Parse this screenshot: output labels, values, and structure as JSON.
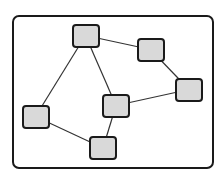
{
  "diagram": {
    "type": "undirected-graph",
    "node_count": 6,
    "edge_count": 7,
    "colors": {
      "frame_border": "#1a1a1a",
      "node_fill": "#d9d9d9",
      "node_border": "#1a1a1a",
      "edge": "#333333",
      "background": "#ffffff"
    },
    "nodes": [
      {
        "id": "n1",
        "label": "",
        "x": 72,
        "y": 24
      },
      {
        "id": "n2",
        "label": "",
        "x": 137,
        "y": 38
      },
      {
        "id": "n3",
        "label": "",
        "x": 175,
        "y": 78
      },
      {
        "id": "n4",
        "label": "",
        "x": 102,
        "y": 94
      },
      {
        "id": "n5",
        "label": "",
        "x": 22,
        "y": 105
      },
      {
        "id": "n6",
        "label": "",
        "x": 89,
        "y": 136
      }
    ],
    "edges": [
      {
        "from": "n1",
        "to": "n2"
      },
      {
        "from": "n2",
        "to": "n3"
      },
      {
        "from": "n3",
        "to": "n4"
      },
      {
        "from": "n1",
        "to": "n4"
      },
      {
        "from": "n1",
        "to": "n5"
      },
      {
        "from": "n5",
        "to": "n6"
      },
      {
        "from": "n4",
        "to": "n6"
      }
    ]
  }
}
